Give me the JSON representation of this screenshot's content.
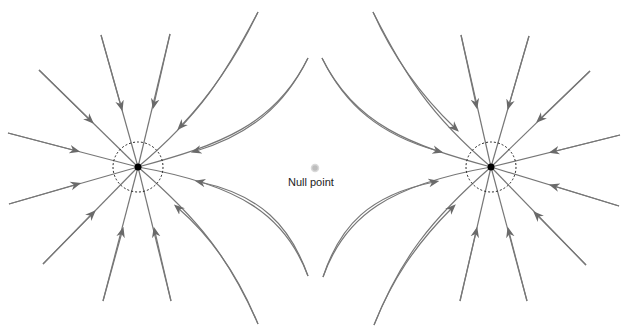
{
  "diagram": {
    "title": "",
    "null_point": {
      "label": "Null point",
      "x": 315,
      "y": 167,
      "color": "#bdbdbd"
    },
    "charges": [
      {
        "name": "left-charge",
        "x": 138,
        "y": 167,
        "ring_radius": 25,
        "color": "#000000"
      },
      {
        "name": "right-charge",
        "x": 491,
        "y": 167,
        "ring_radius": 25,
        "color": "#000000"
      }
    ],
    "line_color": "#777777",
    "field_direction": "inward"
  }
}
